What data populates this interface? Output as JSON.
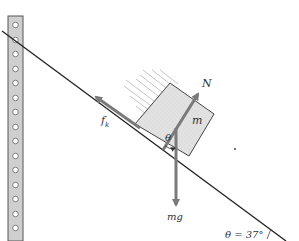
{
  "diagram": {
    "colors": {
      "incline": "#222222",
      "arrow": "#7a7a7a",
      "block_fill": "#e4e4e4",
      "block_stroke": "#444444",
      "post_fill": "#cfcfcf",
      "post_stroke": "#555555",
      "motion_lines": "#b5b5b5"
    },
    "labels": {
      "normal_force": "N",
      "friction": "f",
      "friction_sub": "k",
      "mass": "m",
      "weight": "mg",
      "angle_symbol": "θ",
      "angle_value": "θ = 37°"
    },
    "forces": [
      {
        "name": "normal",
        "label": "N",
        "direction": "perpendicular to incline, up-right"
      },
      {
        "name": "kinetic-friction",
        "label": "fk",
        "direction": "along incline, up-left"
      },
      {
        "name": "weight",
        "label": "mg",
        "direction": "vertically down"
      }
    ],
    "incline_angle_deg": 37,
    "post_holes": 15
  }
}
